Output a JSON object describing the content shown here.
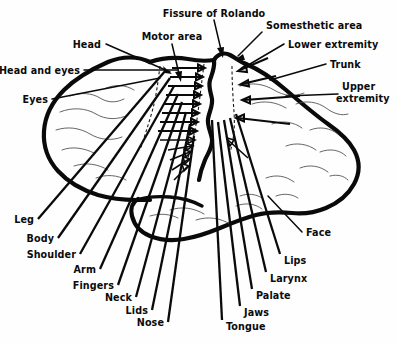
{
  "figure": {
    "background_color": "#fefefe",
    "ink_color": "#0a0a0a"
  },
  "region_labels": {
    "fissure": "Fissure of Rolando",
    "motor_area": "Motor area",
    "somesthetic_area": "Somesthetic area"
  },
  "motor_labels": [
    {
      "text": "Head"
    },
    {
      "text": "Head and eyes"
    },
    {
      "text": "Eyes"
    },
    {
      "text": "Leg"
    },
    {
      "text": "Body"
    },
    {
      "text": "Shoulder"
    },
    {
      "text": "Arm"
    },
    {
      "text": "Fingers"
    },
    {
      "text": "Neck"
    },
    {
      "text": "Lids"
    },
    {
      "text": "Nose"
    }
  ],
  "sensory_labels": [
    {
      "text": "Lower extremity"
    },
    {
      "text": "Trunk"
    },
    {
      "text": "Upper"
    },
    {
      "text": "extremity"
    },
    {
      "text": "Face"
    },
    {
      "text": "Lips"
    },
    {
      "text": "Larynx"
    },
    {
      "text": "Palate"
    },
    {
      "text": "Jaws"
    },
    {
      "text": "Tongue"
    }
  ]
}
